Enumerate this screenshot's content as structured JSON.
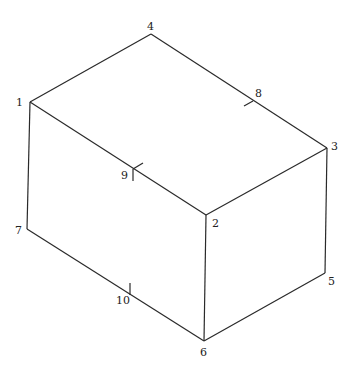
{
  "diagram": {
    "type": "box-element-node-numbering",
    "line_color": "#2a2a2a",
    "nodes": [
      {
        "id": "1",
        "label": "1",
        "x": 30,
        "y": 102,
        "lx": 16,
        "ly": 106,
        "kind": "corner"
      },
      {
        "id": "2",
        "label": "2",
        "x": 206,
        "y": 215,
        "lx": 212,
        "ly": 227,
        "kind": "corner"
      },
      {
        "id": "3",
        "label": "3",
        "x": 327,
        "y": 148,
        "lx": 331,
        "ly": 150,
        "kind": "corner"
      },
      {
        "id": "4",
        "label": "4",
        "x": 151,
        "y": 34,
        "lx": 147,
        "ly": 30,
        "kind": "corner"
      },
      {
        "id": "5",
        "label": "5",
        "x": 325,
        "y": 273,
        "lx": 328,
        "ly": 285,
        "kind": "corner"
      },
      {
        "id": "6",
        "label": "6",
        "x": 204,
        "y": 341,
        "lx": 200,
        "ly": 356,
        "kind": "corner"
      },
      {
        "id": "7",
        "label": "7",
        "x": 27,
        "y": 229,
        "lx": 15,
        "ly": 234,
        "kind": "corner"
      },
      {
        "id": "8",
        "label": "8",
        "x": 253,
        "y": 101,
        "lx": 255,
        "ly": 97,
        "kind": "mid-edge"
      },
      {
        "id": "9",
        "label": "9",
        "x": 133,
        "y": 169,
        "lx": 121,
        "ly": 179,
        "kind": "mid-edge"
      },
      {
        "id": "10",
        "label": "10",
        "x": 130,
        "y": 295,
        "lx": 116,
        "ly": 304,
        "kind": "mid-edge"
      }
    ],
    "edges": [
      {
        "from": "1",
        "to": "4"
      },
      {
        "from": "4",
        "to": "3"
      },
      {
        "from": "1",
        "to": "2"
      },
      {
        "from": "2",
        "to": "3"
      },
      {
        "from": "1",
        "to": "7"
      },
      {
        "from": "2",
        "to": "6"
      },
      {
        "from": "3",
        "to": "5"
      },
      {
        "from": "7",
        "to": "6"
      },
      {
        "from": "6",
        "to": "5"
      }
    ],
    "ticks": [
      {
        "node": "8",
        "x1": 253,
        "y1": 101,
        "x2": 244,
        "y2": 106
      },
      {
        "node": "9",
        "x1": 133,
        "y1": 169,
        "x2": 143,
        "y2": 163
      },
      {
        "node": "9",
        "x1": 133,
        "y1": 169,
        "x2": 133,
        "y2": 181
      },
      {
        "node": "10",
        "x1": 130,
        "y1": 295,
        "x2": 130,
        "y2": 283
      }
    ]
  }
}
